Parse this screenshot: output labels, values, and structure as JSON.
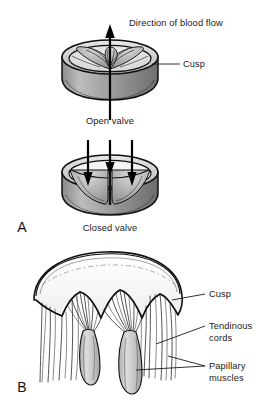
{
  "figure": {
    "title_alt": "Heart valve structure: open valve, closed valve, and cusp with tendinous cords and papillary muscles",
    "panels": [
      {
        "id": "A",
        "panel_label": "A",
        "sub_figures": [
          {
            "id": "open",
            "caption": "Open valve"
          },
          {
            "id": "closed",
            "caption": "Closed valve"
          }
        ],
        "annotations": [
          {
            "id": "flow",
            "text": "Direction of blood flow"
          },
          {
            "id": "cusp-a",
            "text": "Cusp"
          }
        ]
      },
      {
        "id": "B",
        "panel_label": "B",
        "annotations": [
          {
            "id": "cusp-b",
            "text": "Cusp"
          },
          {
            "id": "tendinous",
            "line1": "Tendinous",
            "line2": "cords"
          },
          {
            "id": "papillary",
            "line1": "Papillary",
            "line2": "muscles"
          }
        ]
      }
    ],
    "icons": {
      "up_arrow": "up-arrow-icon",
      "down_arrow": "down-arrow-icon"
    },
    "colors": {
      "ink": "#111111",
      "background": "#ffffff",
      "wall_mid_gray": "#9a9a9a",
      "wall_dark_gray": "#7b7b7b",
      "wall_light_gray": "#c9c9c9",
      "cusp_fill": "#f2f2f2",
      "muscle_gray": "#c2c2c2"
    }
  }
}
